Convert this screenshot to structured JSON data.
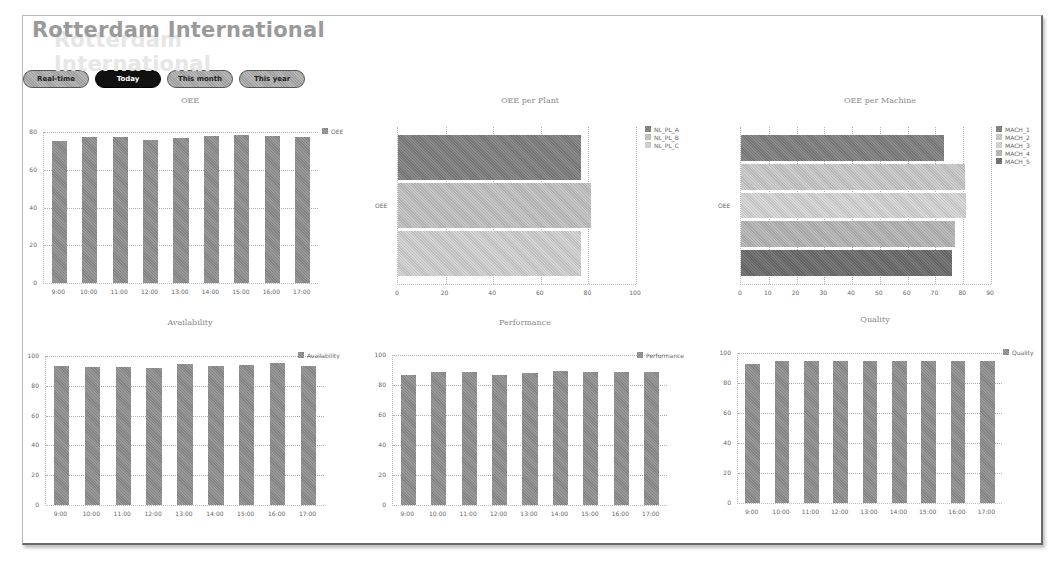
{
  "header": {
    "title": "Rotterdam International"
  },
  "tabs": [
    {
      "label": "Real-time",
      "active": false
    },
    {
      "label": "Today",
      "active": true
    },
    {
      "label": "This month",
      "active": false
    },
    {
      "label": "This year",
      "active": false
    }
  ],
  "chart_data": [
    {
      "id": "oee",
      "type": "bar",
      "title": "OEE",
      "categories": [
        "9:00",
        "10:00",
        "11:00",
        "12:00",
        "13:00",
        "14:00",
        "15:00",
        "16:00",
        "17:00"
      ],
      "series": [
        {
          "name": "OEE",
          "values": [
            75.5,
            77.5,
            77.5,
            76,
            77,
            78,
            78.5,
            78,
            77.5
          ]
        }
      ],
      "yticks": [
        0,
        20,
        40,
        60,
        80
      ],
      "ylim": [
        0,
        80
      ],
      "legend": [
        "OEE"
      ],
      "legend_position": "right",
      "grid": true
    },
    {
      "id": "oee_per_plant",
      "type": "bar",
      "orientation": "horizontal",
      "title": "OEE per Plant",
      "categories": [
        "OEE"
      ],
      "series": [
        {
          "name": "NL_PL_A",
          "values": [
            77
          ],
          "color": "#8c8c8c"
        },
        {
          "name": "NL_PL_B",
          "values": [
            81
          ],
          "color": "#c8c8c8"
        },
        {
          "name": "NL_PL_C",
          "values": [
            77
          ],
          "color": "#d6d6d6"
        }
      ],
      "xticks": [
        0,
        20,
        40,
        60,
        80,
        100
      ],
      "xlim": [
        0,
        100
      ],
      "legend": [
        "NL_PL_A",
        "NL_PL_B",
        "NL_PL_C"
      ],
      "legend_position": "right",
      "grid": true
    },
    {
      "id": "oee_per_machine",
      "type": "bar",
      "orientation": "horizontal",
      "title": "OEE per Machine",
      "categories": [
        "OEE"
      ],
      "series": [
        {
          "name": "MACH_1",
          "values": [
            73
          ],
          "color": "#8c8c8c"
        },
        {
          "name": "MACH_2",
          "values": [
            80.5
          ],
          "color": "#cfcfcf"
        },
        {
          "name": "MACH_3",
          "values": [
            81
          ],
          "color": "#dadada"
        },
        {
          "name": "MACH_4",
          "values": [
            77
          ],
          "color": "#bdbdbd"
        },
        {
          "name": "MACH_5",
          "values": [
            76
          ],
          "color": "#7a7a7a"
        }
      ],
      "xticks": [
        0,
        10,
        20,
        30,
        40,
        50,
        60,
        70,
        80,
        90
      ],
      "xlim": [
        0,
        90
      ],
      "legend": [
        "MACH_1",
        "MACH_2",
        "MACH_3",
        "MACH_4",
        "MACH_5"
      ],
      "legend_position": "right",
      "grid": true
    },
    {
      "id": "availability",
      "type": "bar",
      "title": "Availability",
      "categories": [
        "9:00",
        "10:00",
        "11:00",
        "12:00",
        "13:00",
        "14:00",
        "15:00",
        "16:00",
        "17:00"
      ],
      "series": [
        {
          "name": "Availability",
          "values": [
            93,
            92.5,
            92.5,
            92,
            94.5,
            93.5,
            94,
            95,
            93.5
          ]
        }
      ],
      "yticks": [
        0,
        20,
        40,
        60,
        80,
        100
      ],
      "ylim": [
        0,
        100
      ],
      "legend": [
        "Availability"
      ],
      "legend_position": "right",
      "grid": true
    },
    {
      "id": "performance",
      "type": "bar",
      "title": "Performance",
      "categories": [
        "9:00",
        "10:00",
        "11:00",
        "12:00",
        "13:00",
        "14:00",
        "15:00",
        "16:00",
        "17:00"
      ],
      "series": [
        {
          "name": "Performance",
          "values": [
            87,
            89,
            89,
            87,
            88,
            89.5,
            89,
            88.5,
            89
          ]
        }
      ],
      "yticks": [
        0,
        20,
        40,
        60,
        80,
        100
      ],
      "ylim": [
        0,
        100
      ],
      "legend": [
        "Performance"
      ],
      "legend_position": "right",
      "grid": true
    },
    {
      "id": "quality",
      "type": "bar",
      "title": "Quality",
      "categories": [
        "9:00",
        "10:00",
        "11:00",
        "12:00",
        "13:00",
        "14:00",
        "15:00",
        "16:00",
        "17:00"
      ],
      "series": [
        {
          "name": "Quality",
          "values": [
            93,
            94.5,
            94.5,
            94.5,
            94.5,
            94.5,
            94.5,
            94.5,
            94.5
          ]
        }
      ],
      "yticks": [
        0,
        20,
        40,
        60,
        80,
        100
      ],
      "ylim": [
        0,
        100
      ],
      "legend": [
        "Quality"
      ],
      "legend_position": "right",
      "grid": true
    }
  ]
}
